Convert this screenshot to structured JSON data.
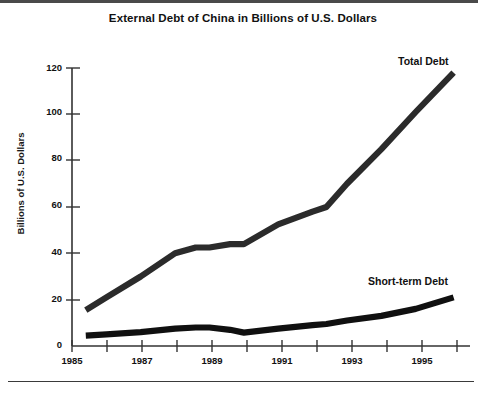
{
  "page": {
    "title": "External Debt of China in Billions of U.S. Dollars",
    "background_color": "#ffffff",
    "ink_color": "#2b2b2b"
  },
  "chart_data": {
    "type": "line",
    "title": "External Debt of China in Billions of U.S. Dollars",
    "xlabel": "",
    "ylabel": "Billions of U.S. Dollars",
    "xlim": [
      1985,
      1996.2
    ],
    "ylim": [
      0,
      120
    ],
    "yticks": [
      0,
      20,
      40,
      60,
      80,
      100,
      120
    ],
    "ytick_labels": [
      "0",
      "20",
      "40",
      "60",
      "80",
      "100",
      "120"
    ],
    "xticks": [
      1985,
      1986,
      1987,
      1988,
      1989,
      1990,
      1991,
      1992,
      1993,
      1994,
      1995,
      1996
    ],
    "xtick_labels": [
      "1985",
      "",
      "1987",
      "",
      "1989",
      "",
      "1991",
      "",
      "1993",
      "",
      "1995",
      ""
    ],
    "xtick_labels_shown": [
      "1985",
      "1987",
      "1989",
      "1991",
      "1993",
      "1995"
    ],
    "grid": false,
    "legend_position": "inline-annotations",
    "x": [
      1985.4,
      1986,
      1987,
      1988,
      1988.6,
      1989,
      1989.6,
      1990,
      1991,
      1992,
      1992.4,
      1993,
      1994,
      1995,
      1996.1
    ],
    "series": [
      {
        "name": "Total Debt",
        "label": "Total Debt",
        "color": "#2b2b2b",
        "values": [
          15.5,
          21,
          30,
          40,
          42.5,
          42.5,
          44,
          44,
          52.5,
          58,
          60,
          70,
          85,
          101,
          118
        ]
      },
      {
        "name": "Short-term Debt",
        "label": "Short-term Debt",
        "color": "#101010",
        "values": [
          4.5,
          5,
          6,
          7.5,
          8,
          8,
          7,
          5.8,
          7.5,
          9,
          9.5,
          11,
          13,
          16,
          21
        ]
      }
    ]
  }
}
